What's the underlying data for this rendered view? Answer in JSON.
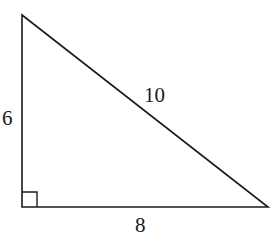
{
  "diagram": {
    "type": "right-triangle",
    "vertices": {
      "top": [
        22,
        15
      ],
      "right_angle": [
        22,
        207
      ],
      "right": [
        268,
        207
      ]
    },
    "right_angle_marker": {
      "x": 22,
      "y": 192,
      "size": 15
    },
    "labels": {
      "vertical_leg": "6",
      "hypotenuse": "10",
      "horizontal_leg": "8"
    },
    "stroke_color": "#1a1a1a"
  }
}
